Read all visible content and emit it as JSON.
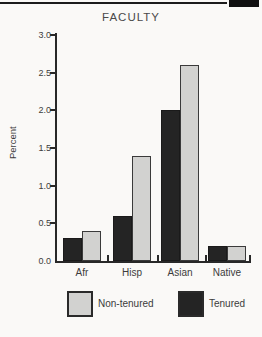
{
  "page": {
    "header_block": "solid-black-tab",
    "header_rule": "horizontal-rule"
  },
  "chart_data": {
    "type": "bar",
    "title": "FACULTY",
    "xlabel": "",
    "ylabel": "Percent",
    "categories": [
      "Afr",
      "Hisp",
      "Asian",
      "Native"
    ],
    "series": [
      {
        "name": "Tenured",
        "color": "#242424",
        "border": "#1a1a1a",
        "values": [
          0.3,
          0.6,
          2.0,
          0.2
        ]
      },
      {
        "name": "Non-tenured",
        "color": "#d2d2d0",
        "border": "#3a3a3a",
        "values": [
          0.4,
          1.4,
          2.6,
          0.2
        ]
      }
    ],
    "ylim": [
      0.0,
      3.0
    ],
    "ytick_step": 0.5,
    "ytick_labels": [
      "0.0",
      "0.5",
      "1.0",
      "1.5",
      "2.0",
      "2.5",
      "3.0"
    ],
    "grid": false,
    "legend_position": "bottom",
    "legend": [
      {
        "label": "Non-tenured",
        "color": "#d2d2d0"
      },
      {
        "label": "Tenured",
        "color": "#242424"
      }
    ]
  }
}
